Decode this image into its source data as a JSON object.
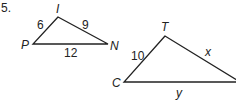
{
  "problem_number": "5.",
  "triangle1": {
    "vertices": {
      "top": "I",
      "left": "P",
      "right": "N"
    },
    "sides": {
      "PI": "6",
      "IN": "9",
      "PN": "12"
    }
  },
  "triangle2": {
    "vertices": {
      "top": "T",
      "left": "C"
    },
    "sides": {
      "CT": "10",
      "T_right": "x",
      "C_right": "y"
    }
  }
}
